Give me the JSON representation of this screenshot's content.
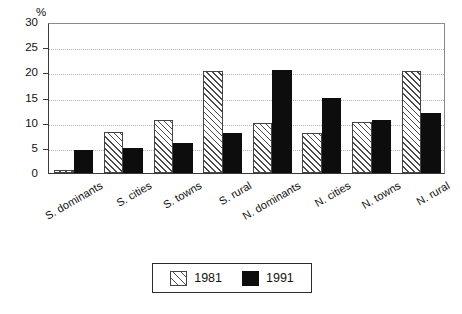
{
  "chart_data": {
    "type": "bar",
    "title": "",
    "subtitle": "",
    "xlabel": "",
    "ylabel": "%",
    "ylim": [
      0,
      30
    ],
    "yticks": [
      0,
      5,
      10,
      15,
      20,
      25,
      30
    ],
    "grid": true,
    "legend_position": "bottom-center",
    "categories": [
      "S. dominants",
      "S. cities",
      "S. towns",
      "S. rural",
      "N. dominants",
      "N. cities",
      "N. towns",
      "N. rural"
    ],
    "series": [
      {
        "name": "1981",
        "pattern": "diagonal-hatch",
        "color": "#ffffff",
        "values": [
          0.5,
          8.1,
          10.5,
          20.2,
          10.0,
          8.0,
          10.2,
          20.3
        ]
      },
      {
        "name": "1991",
        "pattern": "solid",
        "color": "#0d0d0d",
        "values": [
          4.5,
          5.0,
          6.0,
          8.0,
          20.4,
          14.9,
          10.5,
          12.0
        ]
      }
    ]
  },
  "legend": {
    "entries": [
      {
        "label": "1981"
      },
      {
        "label": "1991"
      }
    ]
  }
}
